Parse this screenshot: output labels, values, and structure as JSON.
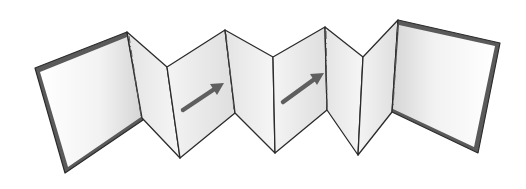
{
  "illustration": {
    "subject": "accordion-fold book",
    "background": "#ffffff",
    "colors": {
      "outline": "#2b2b2b",
      "cover_border": "#5a5a5a",
      "panel_light": "#fbfbfb",
      "panel_shade": "#d9d9d9",
      "arrow": "#5f5f5f",
      "fold_dash": "#555555"
    },
    "arrows": [
      {
        "name": "arrow-1",
        "from": [
          182,
          110
        ],
        "to": [
          224,
          83
        ]
      },
      {
        "name": "arrow-2",
        "from": [
          282,
          102
        ],
        "to": [
          324,
          73
        ]
      }
    ],
    "panel_count": 8
  }
}
